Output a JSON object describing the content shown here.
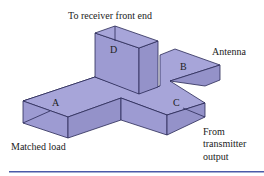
{
  "figure": {
    "colors": {
      "top": "#a7a5d9",
      "front": "#9d9bd2",
      "side": "#9492c9",
      "outline": "#2a2a55",
      "rule": "#4a5aa8"
    },
    "ports": {
      "A": "A",
      "B": "B",
      "C": "C",
      "D": "D"
    },
    "labels": {
      "receiver": "To receiver front end",
      "antenna": "Antenna",
      "matched_load": "Matched load",
      "transmitter_line1": "From",
      "transmitter_line2": "transmitter",
      "transmitter_line3": "output"
    }
  }
}
